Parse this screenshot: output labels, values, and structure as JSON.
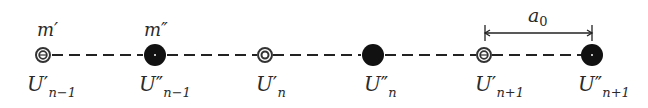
{
  "diagram": {
    "colors": {
      "line": "#222222",
      "atom_heavy": "#111111",
      "atom_light_ring": "#333333",
      "background": "#ffffff"
    },
    "chain_y": 55,
    "atoms": [
      {
        "id": "a1",
        "type": "light",
        "x": 43,
        "label_main": "U",
        "label_prime": "′",
        "label_sub": "n−1",
        "mass_label": "m′"
      },
      {
        "id": "a2",
        "type": "heavy",
        "x": 155,
        "label_main": "U",
        "label_prime": "″",
        "label_sub": "n−1",
        "mass_label": "m″"
      },
      {
        "id": "a3",
        "type": "light",
        "x": 265,
        "label_main": "U",
        "label_prime": "′",
        "label_sub": "n"
      },
      {
        "id": "a4",
        "type": "heavy",
        "x": 373,
        "label_main": "U",
        "label_prime": "″",
        "label_sub": "n"
      },
      {
        "id": "a5",
        "type": "light",
        "x": 484,
        "label_main": "U",
        "label_prime": "′",
        "label_sub": "n+1"
      },
      {
        "id": "a6",
        "type": "heavy",
        "x": 592,
        "label_main": "U",
        "label_prime": "″",
        "label_sub": "n+1"
      }
    ],
    "mass_labels": {
      "light": "m′",
      "heavy": "m″"
    },
    "dimension": {
      "label": "a",
      "label_sub": "0",
      "from_x": 485,
      "to_x": 592,
      "y": 33
    }
  }
}
